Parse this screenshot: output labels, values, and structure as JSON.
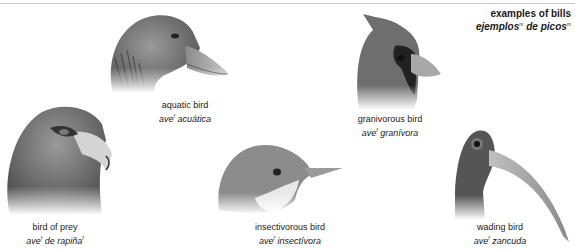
{
  "title": {
    "en": "examples of bills",
    "es_word1": "ejemplos",
    "es_sup1": "m",
    "es_mid": " de ",
    "es_word2": "picos",
    "es_sup2": "m"
  },
  "birds": [
    {
      "id": "aquatic",
      "en": "aquatic bird",
      "es": "ave",
      "es_sup": "f",
      "es_rest": " acuática",
      "es_rest_sup": ""
    },
    {
      "id": "granivorous",
      "en": "granivorous bird",
      "es": "ave",
      "es_sup": "f",
      "es_rest": " granívora",
      "es_rest_sup": ""
    },
    {
      "id": "prey",
      "en": "bird of prey",
      "es": "ave",
      "es_sup": "f",
      "es_rest": " de rapiña",
      "es_rest_sup": "f"
    },
    {
      "id": "insectivorous",
      "en": "insectivorous bird",
      "es": "ave",
      "es_sup": "f",
      "es_rest": " insectívora",
      "es_rest_sup": ""
    },
    {
      "id": "wading",
      "en": "wading bird",
      "es": "ave",
      "es_sup": "f",
      "es_rest": " zancuda",
      "es_rest_sup": ""
    }
  ]
}
